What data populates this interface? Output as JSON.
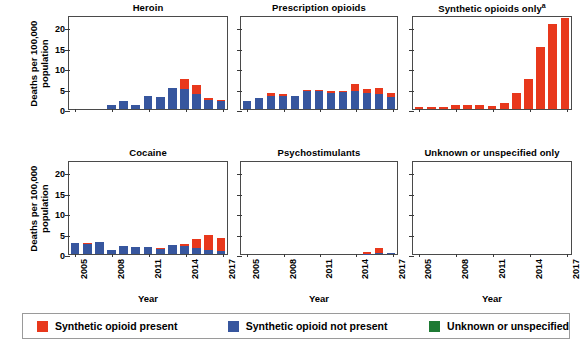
{
  "chart_data": {
    "type": "bar",
    "title": "",
    "xlabel": "Year",
    "ylabel": "Deaths per 100,000\npopulation",
    "ylim": [
      0,
      23
    ],
    "yticks": [
      0,
      5,
      10,
      15,
      20
    ],
    "grid": false,
    "stacked": true,
    "legend_position": "bottom",
    "x": [
      2005,
      2006,
      2007,
      2008,
      2009,
      2010,
      2011,
      2012,
      2013,
      2014,
      2015,
      2016,
      2017
    ],
    "xticklabels": [
      "2005",
      "2008",
      "2011",
      "2014",
      "2017"
    ],
    "xtick_values": [
      2005,
      2008,
      2011,
      2014,
      2017
    ],
    "legend": [
      {
        "label": "Synthetic opioid present",
        "color": "#E8381C",
        "key": "red"
      },
      {
        "label": "Synthetic opioid not present",
        "color": "#37569E",
        "key": "blue"
      },
      {
        "label": "Unknown or unspecified",
        "color": "#1E7A34",
        "key": "green"
      }
    ],
    "panels": [
      {
        "title": "Heroin",
        "title_sup": "",
        "row": 0,
        "col": 0,
        "series": [
          {
            "name": "Synthetic opioid not present",
            "key": "blue",
            "color": "#37569E",
            "values": [
              0,
              0,
              0,
              0.9,
              1.9,
              1.1,
              3.2,
              3.0,
              5.1,
              5.0,
              3.6,
              2.3,
              1.9
            ]
          },
          {
            "name": "Synthetic opioid present",
            "key": "red",
            "color": "#E8381C",
            "values": [
              0,
              0,
              0,
              0.0,
              0.0,
              0.0,
              0.0,
              0.0,
              0.1,
              2.4,
              2.3,
              0.5,
              0.3
            ]
          },
          {
            "name": "Unknown or unspecified",
            "key": "green",
            "color": "#1E7A34",
            "values": [
              0,
              0,
              0,
              0,
              0,
              0,
              0,
              0,
              0,
              0,
              0,
              0,
              0
            ]
          }
        ]
      },
      {
        "title": "Prescription opioids",
        "title_sup": "",
        "row": 0,
        "col": 1,
        "series": [
          {
            "name": "Synthetic opioid not present",
            "key": "blue",
            "color": "#37569E",
            "values": [
              1.9,
              2.7,
              3.1,
              3.2,
              3.1,
              4.4,
              4.4,
              4.0,
              4.2,
              4.5,
              3.8,
              3.7,
              2.9
            ]
          },
          {
            "name": "Synthetic opioid present",
            "key": "red",
            "color": "#E8381C",
            "values": [
              0.0,
              0.1,
              0.9,
              0.4,
              0.2,
              0.3,
              0.3,
              0.4,
              0.3,
              1.7,
              1.2,
              1.4,
              1.1
            ]
          },
          {
            "name": "Unknown or unspecified",
            "key": "green",
            "color": "#1E7A34",
            "values": [
              0,
              0,
              0,
              0,
              0,
              0,
              0,
              0,
              0,
              0,
              0,
              0,
              0
            ]
          }
        ]
      },
      {
        "title": "Synthetic opioids only",
        "title_sup": "a",
        "row": 0,
        "col": 2,
        "series": [
          {
            "name": "Synthetic opioid present",
            "key": "red",
            "color": "#E8381C",
            "values": [
              0.6,
              0.5,
              0.5,
              0.4,
              0.4,
              0.9,
              1.0,
              1.0,
              0.8,
              1.4,
              3.8,
              7.4,
              15.1,
              20.9,
              22.2
            ]
          },
          {
            "name": "Synthetic opioid not present",
            "key": "blue",
            "color": "#37569E",
            "values": [
              0,
              0,
              0,
              0,
              0,
              0,
              0,
              0,
              0,
              0,
              0,
              0,
              0
            ]
          },
          {
            "name": "Unknown or unspecified",
            "key": "green",
            "color": "#1E7A34",
            "values": [
              0,
              0,
              0,
              0,
              0,
              0,
              0,
              0,
              0,
              0,
              0,
              0,
              0
            ]
          }
        ]
      },
      {
        "title": "Cocaine",
        "title_sup": "",
        "row": 1,
        "col": 0,
        "series": [
          {
            "name": "Synthetic opioid not present",
            "key": "blue",
            "color": "#37569E",
            "values": [
              2.8,
              2.5,
              3.0,
              0.9,
              1.9,
              1.6,
              1.7,
              1.3,
              2.1,
              1.9,
              1.5,
              1.1,
              0.8
            ]
          },
          {
            "name": "Synthetic opioid present",
            "key": "red",
            "color": "#E8381C",
            "values": [
              0.0,
              0.2,
              0.0,
              0.1,
              0.1,
              0.1,
              0.1,
              0.1,
              0.2,
              0.6,
              2.1,
              3.6,
              3.1
            ]
          },
          {
            "name": "Unknown or unspecified",
            "key": "green",
            "color": "#1E7A34",
            "values": [
              0,
              0,
              0,
              0,
              0,
              0,
              0,
              0,
              0,
              0,
              0,
              0,
              0
            ]
          }
        ]
      },
      {
        "title": "Psychostimulants",
        "title_sup": "",
        "row": 1,
        "col": 1,
        "series": [
          {
            "name": "Synthetic opioid not present",
            "key": "blue",
            "color": "#37569E",
            "values": [
              0,
              0,
              0,
              0,
              0,
              0,
              0,
              0,
              0,
              0,
              0.1,
              0.2,
              0.2
            ]
          },
          {
            "name": "Synthetic opioid present",
            "key": "red",
            "color": "#E8381C",
            "values": [
              0,
              0,
              0,
              0,
              0,
              0,
              0,
              0,
              0,
              0,
              0.4,
              1.3,
              0.0
            ]
          },
          {
            "name": "Unknown or unspecified",
            "key": "green",
            "color": "#1E7A34",
            "values": [
              0,
              0,
              0,
              0,
              0,
              0,
              0,
              0,
              0,
              0,
              0,
              0,
              0
            ]
          }
        ]
      },
      {
        "title": "Unknown or unspecified only",
        "title_sup": "",
        "row": 1,
        "col": 2,
        "series": [
          {
            "name": "Synthetic opioid not present",
            "key": "blue",
            "color": "#37569E",
            "values": [
              0,
              0,
              0,
              0,
              0,
              0,
              0,
              0,
              0,
              0,
              0,
              0,
              0
            ]
          },
          {
            "name": "Synthetic opioid present",
            "key": "red",
            "color": "#E8381C",
            "values": [
              0,
              0,
              0,
              0,
              0,
              0,
              0,
              0,
              0,
              0,
              0,
              0,
              0
            ]
          },
          {
            "name": "Unknown or unspecified",
            "key": "green",
            "color": "#1E7A34",
            "values": [
              0,
              0,
              0,
              0,
              0,
              0,
              0,
              0,
              0,
              0,
              0,
              0,
              0
            ]
          }
        ]
      }
    ]
  }
}
